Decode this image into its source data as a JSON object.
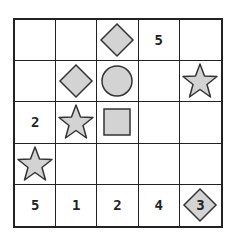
{
  "puzzle": {
    "rows": 5,
    "cols": 5,
    "colors": {
      "fill": "#d3d3d3",
      "stroke": "#333333",
      "grid": "#222222",
      "text": "#222222"
    },
    "cells": [
      [
        {
          "shape": "",
          "num": ""
        },
        {
          "shape": "",
          "num": ""
        },
        {
          "shape": "diamond",
          "num": ""
        },
        {
          "shape": "",
          "num": "5"
        },
        {
          "shape": "",
          "num": ""
        }
      ],
      [
        {
          "shape": "",
          "num": ""
        },
        {
          "shape": "diamond",
          "num": ""
        },
        {
          "shape": "circle",
          "num": ""
        },
        {
          "shape": "",
          "num": ""
        },
        {
          "shape": "star",
          "num": ""
        }
      ],
      [
        {
          "shape": "",
          "num": "2"
        },
        {
          "shape": "star",
          "num": ""
        },
        {
          "shape": "square",
          "num": ""
        },
        {
          "shape": "",
          "num": ""
        },
        {
          "shape": "",
          "num": ""
        }
      ],
      [
        {
          "shape": "star",
          "num": ""
        },
        {
          "shape": "",
          "num": ""
        },
        {
          "shape": "",
          "num": ""
        },
        {
          "shape": "",
          "num": ""
        },
        {
          "shape": "",
          "num": ""
        }
      ],
      [
        {
          "shape": "",
          "num": "5"
        },
        {
          "shape": "",
          "num": "1"
        },
        {
          "shape": "",
          "num": "2"
        },
        {
          "shape": "",
          "num": "4"
        },
        {
          "shape": "diamond",
          "num": "3"
        }
      ]
    ]
  }
}
